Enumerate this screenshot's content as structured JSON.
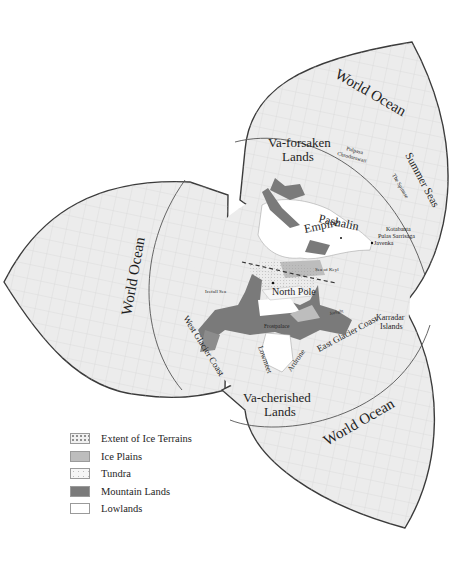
{
  "map": {
    "ocean_labels": {
      "top": "World Ocean",
      "left": "World Ocean",
      "bottom": "World Ocean"
    },
    "region_labels": {
      "va_forsaken_line1": "Va-forsaken",
      "va_forsaken_line2": "Lands",
      "va_cherished_line1": "Va-cherished",
      "va_cherished_line2": "Lands",
      "pashalin_line1": "Pashalin",
      "pashalin_line2": "Empire",
      "summer_seas": "Summer Seas",
      "north_pole": "North Pole",
      "west_glacier_coast": "West Glacier Coast",
      "east_glacier_coast": "East Glacier Coast",
      "karradar_line1": "Karradar",
      "karradar_line2": "Islands"
    },
    "small_labels": {
      "pulpasa_line1": "Pulpasa",
      "pulpasa_line2": "Chrodorswati",
      "the_spinne": "The Spinnse",
      "kotabanta": "Kotabanta",
      "pulas_sarrisaga": "Pulas Sarrisaga",
      "javenka": "Javenka",
      "sea_of_keyl": "Sea of Keyl",
      "icefall_sea": "Icefall Sea",
      "frostpalace": "Frostpalace",
      "lowmeet": "Lowmeet",
      "ardrone": "Ardrone",
      "jorlight": "Jorlight"
    },
    "colors": {
      "ocean": "#ececec",
      "grid": "#c8c8c8",
      "border": "#3a3a3a",
      "mountain": "#7a7a7a",
      "ice_plains": "#bdbdbd",
      "lowlands": "#ffffff"
    }
  },
  "legend": {
    "items": [
      {
        "label": "Extent of Ice Terrains",
        "swatch": "dotted"
      },
      {
        "label": "Ice Plains",
        "swatch": "light-gray"
      },
      {
        "label": "Tundra",
        "swatch": "speckled-white"
      },
      {
        "label": "Mountain Lands",
        "swatch": "dark-gray"
      },
      {
        "label": "Lowlands",
        "swatch": "white"
      }
    ]
  }
}
